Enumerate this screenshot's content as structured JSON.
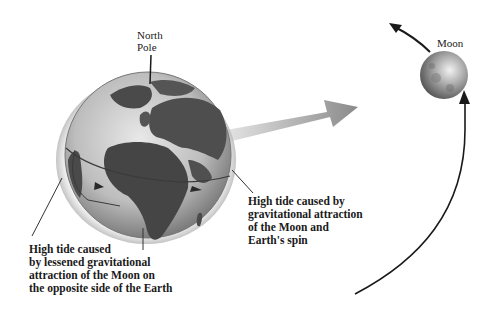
{
  "diagram": {
    "type": "tides-earth-moon",
    "labels": {
      "north_pole": [
        "North",
        "Pole"
      ],
      "moon": "Moon",
      "high_tide_near": [
        "High tide caused by",
        "gravitational attraction",
        "of the Moon and",
        "Earth's spin"
      ],
      "high_tide_far": [
        "High tide caused",
        "by lessened gravitational",
        "attraction of the Moon on",
        "the opposite side of the Earth"
      ]
    },
    "elements": {
      "earth": "globe-showing-europe-africa",
      "moon": "moon-sphere",
      "gravity_arrow": "arrow-earth-to-moon",
      "moon_orbit": "curved-orbit-arrow",
      "tidal_bulge": "water-envelope-ellipse"
    },
    "colors": {
      "ink": "#1a1a1a",
      "ocean": "#cfcfcf",
      "land": "#4a4a4a",
      "arrow": "#9a9a9a",
      "moon": "#8c8c8c"
    }
  }
}
